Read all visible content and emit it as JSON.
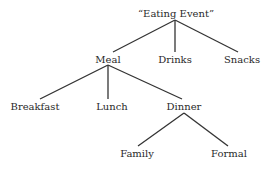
{
  "diagram": {
    "type": "tree",
    "nodes": {
      "root": "“Eating Event”",
      "meal": "Meal",
      "drinks": "Drinks",
      "snacks": "Snacks",
      "breakfast": "Breakfast",
      "lunch": "Lunch",
      "dinner": "Dinner",
      "family": "Family",
      "formal": "Formal"
    },
    "edges": [
      [
        "root",
        "meal"
      ],
      [
        "root",
        "drinks"
      ],
      [
        "root",
        "snacks"
      ],
      [
        "meal",
        "breakfast"
      ],
      [
        "meal",
        "lunch"
      ],
      [
        "meal",
        "dinner"
      ],
      [
        "dinner",
        "family"
      ],
      [
        "dinner",
        "formal"
      ]
    ],
    "line_color": "#333333"
  }
}
